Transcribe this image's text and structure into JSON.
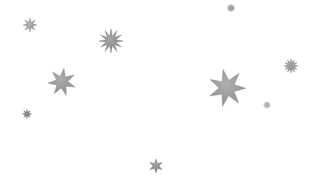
{
  "scene": {
    "width": 312,
    "height": 184,
    "background": "#ffffff",
    "description": "Scattered gray sparkle stars on white background",
    "stars": [
      {
        "id": "star-large-7pt",
        "cx": 227,
        "cy": 88,
        "outer": 19,
        "inner": 8,
        "points": 7,
        "rotation": -12,
        "color": "#8c8c8c",
        "highlight": "#b0b0b0"
      },
      {
        "id": "star-medium-7pt",
        "cx": 62,
        "cy": 82,
        "outer": 14,
        "inner": 6,
        "points": 7,
        "rotation": 8,
        "color": "#8a8a8a",
        "highlight": "#acacac"
      },
      {
        "id": "star-spiky-left",
        "cx": 111,
        "cy": 41,
        "outer": 12,
        "inner": 5,
        "points": 12,
        "rotation": 0,
        "color": "#7f7f7f",
        "highlight": "#a5a5a5"
      },
      {
        "id": "star-small-topleft",
        "cx": 30,
        "cy": 25,
        "outer": 7,
        "inner": 3,
        "points": 8,
        "rotation": 0,
        "color": "#8e8e8e",
        "highlight": "#b3b3b3"
      },
      {
        "id": "star-spiky-right",
        "cx": 291,
        "cy": 66,
        "outer": 7,
        "inner": 3.5,
        "points": 12,
        "rotation": 0,
        "color": "#8a8a8a",
        "highlight": "#a8a8a8"
      },
      {
        "id": "star-small-bottom",
        "cx": 156,
        "cy": 166,
        "outer": 7,
        "inner": 3,
        "points": 6,
        "rotation": 0,
        "color": "#7e7e7e",
        "highlight": "#a2a2a2"
      },
      {
        "id": "star-tiny-left",
        "cx": 27,
        "cy": 114,
        "outer": 4.5,
        "inner": 2,
        "points": 8,
        "rotation": 0,
        "color": "#6e6e6e",
        "highlight": "#8f8f8f"
      },
      {
        "id": "star-tiny-top",
        "cx": 231,
        "cy": 8,
        "outer": 4,
        "inner": 2,
        "points": 8,
        "rotation": 0,
        "color": "#8c8c8c",
        "highlight": "#aaaaaa"
      },
      {
        "id": "star-tiny-right",
        "cx": 267,
        "cy": 105,
        "outer": 3.5,
        "inner": 1.8,
        "points": 8,
        "rotation": 0,
        "color": "#a0a0a0",
        "highlight": "#bcbcbc"
      }
    ]
  }
}
